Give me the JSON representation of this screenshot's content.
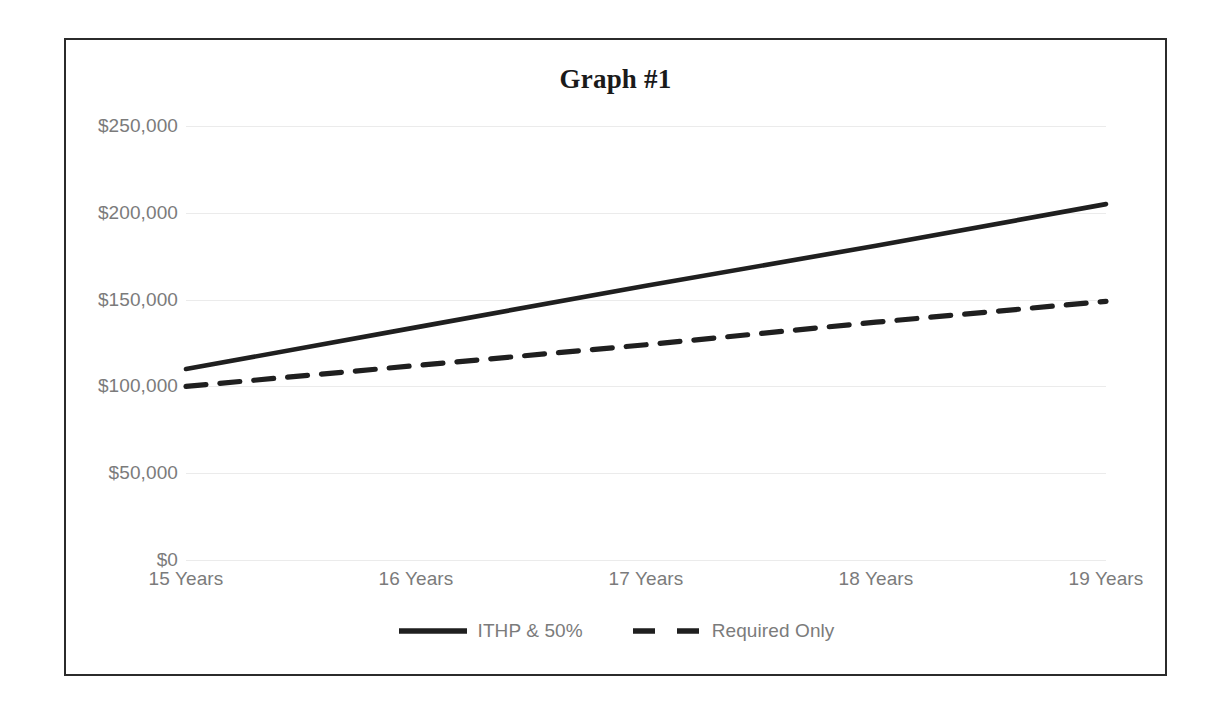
{
  "chart_data": {
    "type": "line",
    "title": "Graph #1",
    "xlabel": "",
    "ylabel": "",
    "categories": [
      "15 Years",
      "16 Years",
      "17 Years",
      "18 Years",
      "19 Years"
    ],
    "series": [
      {
        "name": "ITHP & 50%",
        "style": "solid",
        "color": "#1f1f1f",
        "values": [
          110000,
          134000,
          158000,
          181000,
          205000
        ]
      },
      {
        "name": "Required Only",
        "style": "dashed",
        "color": "#1f1f1f",
        "values": [
          100000,
          112000,
          124000,
          137000,
          149000
        ]
      }
    ],
    "ylim": [
      0,
      250000
    ],
    "yticks": [
      0,
      50000,
      100000,
      150000,
      200000,
      250000
    ],
    "ytick_labels": [
      "$0",
      "$50,000",
      "$100,000",
      "$150,000",
      "$200,000",
      "$250,000"
    ],
    "grid": true,
    "grid_color": "#ebebeb",
    "legend_position": "bottom",
    "frame_color": "#2b2b2b",
    "background": "#ffffff",
    "tick_label_color": "#7b7b7b"
  },
  "axis": {
    "y": {
      "labels": [
        "$250,000",
        "$200,000",
        "$150,000",
        "$100,000",
        "$50,000",
        "$0"
      ]
    },
    "x": {
      "labels": [
        "15 Years",
        "16 Years",
        "17 Years",
        "18 Years",
        "19 Years"
      ]
    }
  },
  "legend": {
    "items": [
      {
        "label": "ITHP & 50%",
        "style": "solid"
      },
      {
        "label": "Required Only",
        "style": "dashed"
      }
    ]
  }
}
